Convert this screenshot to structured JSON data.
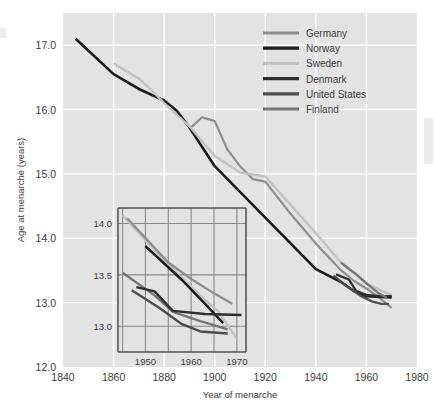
{
  "chart_data": {
    "type": "line",
    "title": "",
    "xlabel": "Year of menarche",
    "ylabel": "Age at menarche (years)",
    "xlim": [
      1840,
      1980
    ],
    "ylim": [
      12.0,
      17.5
    ],
    "xticks": [
      1840,
      1860,
      1880,
      1900,
      1920,
      1940,
      1960,
      1980
    ],
    "xticklabels": [
      "1840",
      "1860",
      "1880",
      "1900",
      "1920",
      "1940",
      "1960",
      "1980"
    ],
    "yticks": [
      12.0,
      13.0,
      14.0,
      15.0,
      16.0,
      17.0
    ],
    "yticklabels": [
      "12.0",
      "13.0",
      "14.0",
      "15.0",
      "16.0",
      "17.0"
    ],
    "grid": true,
    "legend_position": "top-right",
    "series": [
      {
        "name": "Germany",
        "color": "#8e8e8e",
        "width": 2.2,
        "points": [
          [
            1890,
            15.7
          ],
          [
            1895,
            15.88
          ],
          [
            1900,
            15.82
          ],
          [
            1905,
            15.38
          ],
          [
            1910,
            15.12
          ],
          [
            1915,
            14.92
          ],
          [
            1920,
            14.88
          ],
          [
            1930,
            14.38
          ],
          [
            1940,
            13.92
          ],
          [
            1950,
            13.5
          ],
          [
            1955,
            13.34
          ],
          [
            1960,
            13.22
          ],
          [
            1965,
            13.08
          ],
          [
            1970,
            12.92
          ]
        ]
      },
      {
        "name": "Norway",
        "color": "#1a1a1a",
        "width": 2.6,
        "points": [
          [
            1845,
            17.1
          ],
          [
            1860,
            16.55
          ],
          [
            1870,
            16.32
          ],
          [
            1880,
            16.14
          ],
          [
            1885,
            15.98
          ],
          [
            1890,
            15.72
          ],
          [
            1900,
            15.12
          ],
          [
            1910,
            14.72
          ],
          [
            1920,
            14.32
          ],
          [
            1930,
            13.92
          ],
          [
            1940,
            13.52
          ],
          [
            1950,
            13.32
          ],
          [
            1955,
            13.18
          ],
          [
            1960,
            13.1
          ],
          [
            1970,
            13.08
          ]
        ]
      },
      {
        "name": "Sweden",
        "color": "#c2c2c2",
        "width": 2.4,
        "points": [
          [
            1860,
            16.72
          ],
          [
            1870,
            16.48
          ],
          [
            1875,
            16.3
          ],
          [
            1880,
            16.1
          ],
          [
            1890,
            15.74
          ],
          [
            1900,
            15.28
          ],
          [
            1910,
            15.02
          ],
          [
            1920,
            14.96
          ],
          [
            1930,
            14.52
          ],
          [
            1940,
            14.08
          ],
          [
            1950,
            13.62
          ],
          [
            1960,
            13.3
          ],
          [
            1965,
            13.2
          ],
          [
            1970,
            13.12
          ]
        ]
      },
      {
        "name": "Denmark",
        "color": "#2e2e2e",
        "width": 2.3,
        "points": [
          [
            1948,
            13.44
          ],
          [
            1953,
            13.36
          ],
          [
            1956,
            13.18
          ],
          [
            1960,
            13.12
          ],
          [
            1965,
            13.1
          ],
          [
            1970,
            13.1
          ]
        ]
      },
      {
        "name": "United States",
        "color": "#4d4d4d",
        "width": 2.3,
        "points": [
          [
            1947,
            13.42
          ],
          [
            1952,
            13.26
          ],
          [
            1958,
            13.1
          ],
          [
            1962,
            13.02
          ],
          [
            1966,
            12.98
          ],
          [
            1969,
            12.98
          ]
        ]
      },
      {
        "name": "Finland",
        "color": "#757575",
        "width": 2.3,
        "points": [
          [
            1950,
            13.62
          ],
          [
            1956,
            13.44
          ],
          [
            1960,
            13.3
          ],
          [
            1965,
            13.14
          ],
          [
            1968,
            13.08
          ]
        ]
      }
    ]
  },
  "inset_chart": {
    "type": "line",
    "xlim": [
      1944,
      1972
    ],
    "ylim": [
      12.75,
      14.15
    ],
    "xticks": [
      1950,
      1960,
      1970
    ],
    "xticklabels": [
      "1950",
      "1960",
      "1970"
    ],
    "yticks": [
      13.0,
      13.5,
      14.0
    ],
    "yticklabels": [
      "13.0",
      "13.5",
      "14.0"
    ],
    "gridx": [
      1945,
      1950,
      1955,
      1960,
      1965,
      1970
    ],
    "gridy": [
      13.0,
      13.5,
      14.0
    ],
    "series": [
      {
        "name": "Sweden",
        "color": "#c2c2c2",
        "width": 2.4,
        "points": [
          [
            1945,
            14.08
          ],
          [
            1955,
            13.6
          ],
          [
            1962,
            13.3
          ],
          [
            1966,
            13.14
          ],
          [
            1970,
            12.88
          ]
        ]
      },
      {
        "name": "Germany",
        "color": "#8e8e8e",
        "width": 2.3,
        "points": [
          [
            1946,
            14.05
          ],
          [
            1955,
            13.62
          ],
          [
            1960,
            13.46
          ],
          [
            1965,
            13.32
          ],
          [
            1969,
            13.22
          ]
        ]
      },
      {
        "name": "Norway",
        "color": "#1a1a1a",
        "width": 2.5,
        "points": [
          [
            1950,
            13.78
          ],
          [
            1958,
            13.45
          ],
          [
            1963,
            13.22
          ],
          [
            1967,
            13.03
          ]
        ]
      },
      {
        "name": "Finland",
        "color": "#757575",
        "width": 2.3,
        "points": [
          [
            1945,
            13.52
          ],
          [
            1952,
            13.3
          ],
          [
            1956,
            13.14
          ],
          [
            1962,
            13.05
          ],
          [
            1968,
            12.97
          ]
        ]
      },
      {
        "name": "Denmark",
        "color": "#2e2e2e",
        "width": 2.4,
        "points": [
          [
            1948,
            13.38
          ],
          [
            1952,
            13.34
          ],
          [
            1956,
            13.15
          ],
          [
            1963,
            13.12
          ],
          [
            1971,
            13.11
          ]
        ]
      },
      {
        "name": "United States",
        "color": "#4d4d4d",
        "width": 2.4,
        "points": [
          [
            1947,
            13.35
          ],
          [
            1953,
            13.18
          ],
          [
            1958,
            13.02
          ],
          [
            1962,
            12.95
          ],
          [
            1968,
            12.93
          ]
        ]
      }
    ]
  },
  "legend": {
    "entries": [
      {
        "label": "Germany",
        "color": "#8e8e8e"
      },
      {
        "label": "Norway",
        "color": "#1a1a1a"
      },
      {
        "label": "Sweden",
        "color": "#c2c2c2"
      },
      {
        "label": "Denmark",
        "color": "#2e2e2e"
      },
      {
        "label": "United States",
        "color": "#4d4d4d"
      },
      {
        "label": "Finland",
        "color": "#757575"
      }
    ]
  },
  "style": {
    "plot_background": "#e3e3e3",
    "gridline_color": "#ffffff",
    "inset_grid_color": "#8a8a8a",
    "inset_frame_color": "#555555",
    "text_color": "#3b3b3b",
    "page_background": "#ffffff"
  }
}
